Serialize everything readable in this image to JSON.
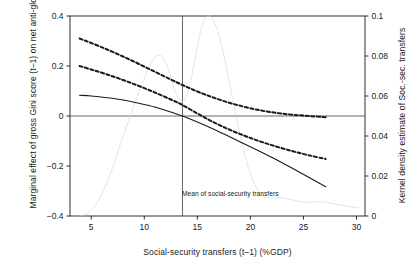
{
  "figure": {
    "width": 420,
    "height": 270,
    "background": "#ffffff",
    "foreground": "#1a1a1a",
    "density_color": "#d9d9d9"
  },
  "chart_data": {
    "type": "line",
    "title": "",
    "xlabel": "Social-security transfers (t–1) (%GDP)",
    "ylabel": "Marginal effect of gross Gini score (t–1) on net anti-globalization (broad)",
    "ylabel_right": "Kernel density estimate of Soc.-sec. transfers",
    "grid": false,
    "legend": "none",
    "xlim": [
      3.0,
      30.8
    ],
    "ylim": [
      -0.4,
      0.4
    ],
    "ylim_right": [
      0,
      0.1
    ],
    "xticks": [
      5,
      10,
      15,
      20,
      25,
      30
    ],
    "xtick_labels": [
      "5",
      "10",
      "15",
      "20",
      "25",
      "30"
    ],
    "yticks": [
      -0.4,
      -0.2,
      0,
      0.2,
      0.4
    ],
    "ytick_labels": [
      "−0.4",
      "−0.2",
      "0",
      "0.2",
      "0.4"
    ],
    "yticks_right": [
      0,
      0.02,
      0.04,
      0.06,
      0.08,
      0.1
    ],
    "ytick_labels_right": [
      "0",
      "0.02",
      "0.04",
      "0.06",
      "0.08",
      "0.1"
    ],
    "annotations": [
      {
        "name": "mean-of-social-security-transfers",
        "text": "Mean of social-security transfers",
        "x": 13.6,
        "type": "vertical-line-label"
      }
    ],
    "reference_lines": [
      {
        "name": "zero-line",
        "orientation": "horizontal",
        "y": 0,
        "style": "solid"
      },
      {
        "name": "mean-line",
        "orientation": "vertical",
        "x": 13.6,
        "style": "solid"
      }
    ],
    "series": [
      {
        "name": "Marginal effect (point estimate)",
        "style": "solid",
        "axis": "left",
        "x": [
          3.9,
          5.0,
          6.5,
          8.0,
          9.5,
          11.0,
          12.5,
          13.6,
          15.0,
          16.5,
          18.0,
          19.5,
          21.0,
          22.5,
          24.0,
          25.5,
          27.1
        ],
        "y": [
          0.083,
          0.08,
          0.073,
          0.064,
          0.051,
          0.036,
          0.016,
          0.0,
          -0.024,
          -0.052,
          -0.082,
          -0.113,
          -0.144,
          -0.176,
          -0.21,
          -0.245,
          -0.283
        ]
      },
      {
        "name": "Upper 95% confidence bound",
        "style": "dashed",
        "axis": "left",
        "x": [
          3.9,
          5.0,
          6.5,
          8.0,
          9.5,
          11.0,
          12.5,
          13.6,
          15.0,
          16.5,
          18.0,
          19.5,
          21.0,
          22.5,
          24.0,
          25.5,
          27.1
        ],
        "y": [
          0.31,
          0.292,
          0.266,
          0.238,
          0.208,
          0.177,
          0.146,
          0.124,
          0.098,
          0.074,
          0.053,
          0.036,
          0.022,
          0.012,
          0.005,
          0.0,
          -0.005
        ]
      },
      {
        "name": "Lower 95% confidence bound",
        "style": "dashed",
        "axis": "left",
        "x": [
          3.9,
          5.0,
          6.5,
          8.0,
          9.5,
          11.0,
          12.5,
          13.6,
          15.0,
          16.5,
          18.0,
          19.5,
          21.0,
          22.5,
          24.0,
          25.5,
          27.1
        ],
        "y": [
          0.2,
          0.186,
          0.166,
          0.144,
          0.12,
          0.094,
          0.066,
          0.044,
          0.01,
          -0.024,
          -0.054,
          -0.08,
          -0.103,
          -0.123,
          -0.141,
          -0.157,
          -0.172
        ]
      },
      {
        "name": "Kernel density of social-security transfers",
        "style": "dotted",
        "axis": "right",
        "x": [
          3.9,
          4.5,
          5.2,
          6.0,
          6.8,
          7.5,
          8.2,
          8.9,
          9.5,
          10.1,
          10.6,
          11.1,
          11.6,
          12.0,
          12.4,
          12.8,
          13.2,
          13.6,
          14.0,
          14.4,
          14.8,
          15.2,
          15.6,
          16.0,
          16.5,
          17.0,
          17.6,
          18.2,
          18.8,
          19.4,
          20.0,
          20.6,
          21.2,
          21.8,
          22.4,
          23.0,
          24.0,
          25.0,
          26.0,
          27.0,
          28.0,
          29.0,
          30.3
        ],
        "y": [
          0.0,
          0.001,
          0.004,
          0.011,
          0.021,
          0.032,
          0.043,
          0.053,
          0.062,
          0.07,
          0.076,
          0.08,
          0.08,
          0.077,
          0.071,
          0.064,
          0.059,
          0.057,
          0.06,
          0.068,
          0.079,
          0.09,
          0.097,
          0.1,
          0.098,
          0.091,
          0.078,
          0.062,
          0.046,
          0.032,
          0.021,
          0.014,
          0.01,
          0.009,
          0.009,
          0.009,
          0.008,
          0.007,
          0.007,
          0.007,
          0.006,
          0.005,
          0.004
        ]
      }
    ]
  }
}
